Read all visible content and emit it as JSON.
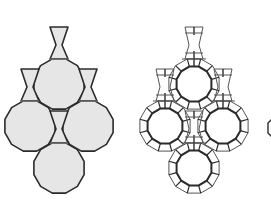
{
  "diagram": {
    "width": 271,
    "height": 201,
    "colors": {
      "background": "#ffffff",
      "fill": "#e6e6e6",
      "stroke": "#2b2b2b",
      "thin_stroke": "#555555",
      "neck_line": "#888888"
    },
    "left_figure": {
      "description": "solid vase-shaped tiles: dodecagons with hourglass necks",
      "units": [
        {
          "cx": 59,
          "cy": 84,
          "r": 26,
          "neck": {
            "top": 27,
            "waist": 45,
            "base": 59,
            "half_top": 9,
            "half_waist": 3,
            "half_base": 9
          }
        },
        {
          "cx": 30,
          "cy": 126,
          "r": 26,
          "neck": {
            "top": 69,
            "waist": 87,
            "base": 101,
            "half_top": 9,
            "half_waist": 3,
            "half_base": 9
          }
        },
        {
          "cx": 88,
          "cy": 126,
          "r": 26,
          "neck": {
            "top": 69,
            "waist": 87,
            "base": 101,
            "half_top": 9,
            "half_waist": 3,
            "half_base": 9
          }
        },
        {
          "cx": 59,
          "cy": 168,
          "r": 26,
          "neck": {
            "top": 111,
            "waist": 129,
            "base": 143,
            "half_top": 9,
            "half_waist": 3,
            "half_base": 9
          }
        }
      ]
    },
    "right_figure": {
      "description": "framework of small squares/hexagons outlining large rings",
      "offset_x": 135,
      "ring_r_outer": 26,
      "ring_r_inner": 18
    },
    "partial_edge_shape": {
      "x": 268,
      "y": 128
    }
  }
}
